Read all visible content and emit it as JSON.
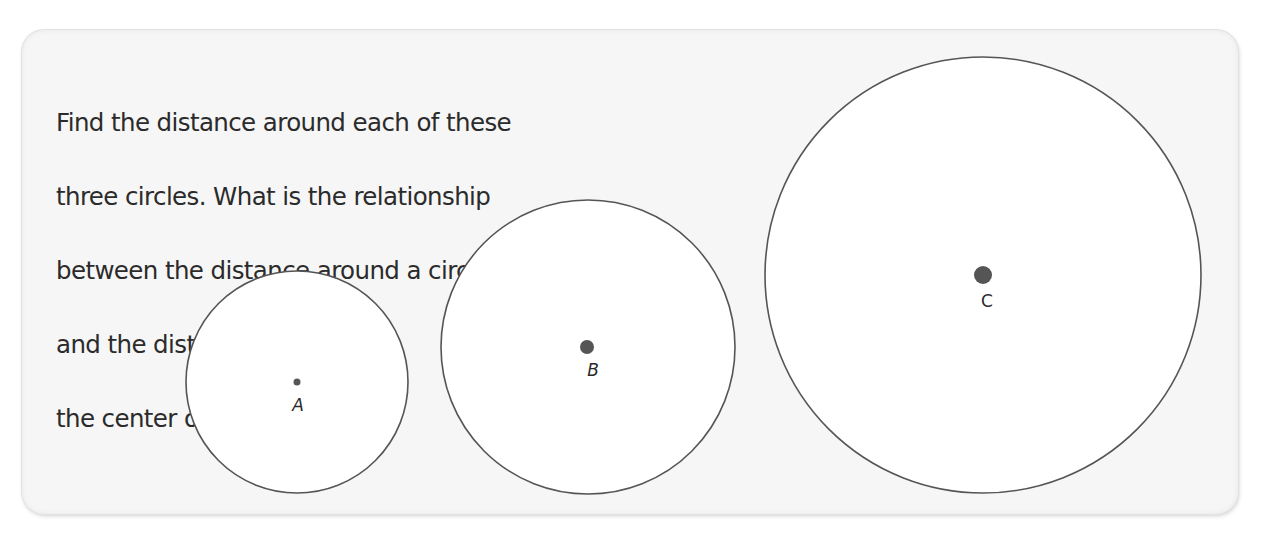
{
  "problem": {
    "prompt_lines": [
      "Find the distance around each of these",
      "three circles. What is the relationship",
      "between the distance around a circle",
      "and the distance across",
      "the center of the circle?"
    ]
  },
  "figure": {
    "stroke_color": "#555555",
    "dot_color": "#555555",
    "circles": [
      {
        "label": "A",
        "cx": 297,
        "cy": 382,
        "r": 111,
        "dot_r": 3.5,
        "label_x": 298,
        "label_y": 411
      },
      {
        "label": "B",
        "cx": 588,
        "cy": 347,
        "r": 147,
        "dot_r": 7,
        "label_x": 593,
        "label_y": 376
      },
      {
        "label": "C",
        "cx": 983,
        "cy": 275,
        "r": 218,
        "dot_r": 9,
        "label_x": 987,
        "label_y": 307
      }
    ]
  }
}
